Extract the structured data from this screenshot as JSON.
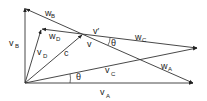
{
  "diagram": {
    "type": "vector diagram",
    "vectors": [
      {
        "name": "V_A",
        "main": "v",
        "sub": "A"
      },
      {
        "name": "V_B",
        "main": "v",
        "sub": "B"
      },
      {
        "name": "V_C",
        "main": "v",
        "sub": "C"
      },
      {
        "name": "V_D",
        "main": "v",
        "sub": "D"
      },
      {
        "name": "W_A",
        "main": "w",
        "sub": "A"
      },
      {
        "name": "W_B",
        "main": "w",
        "sub": "B"
      },
      {
        "name": "W_C",
        "main": "w",
        "sub": "C"
      },
      {
        "name": "W_D",
        "main": "w",
        "sub": "D"
      },
      {
        "name": "c",
        "main": "c"
      },
      {
        "name": "v",
        "main": "v"
      },
      {
        "name": "v'",
        "main": "v′"
      }
    ],
    "angles": [
      {
        "label": "θ"
      },
      {
        "label": "θ"
      }
    ]
  }
}
